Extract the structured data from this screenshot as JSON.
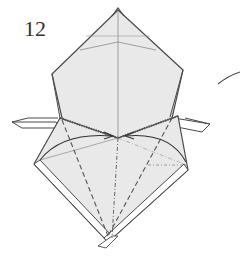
{
  "diagram": {
    "type": "origami-folding-step",
    "step_number": "12",
    "colors": {
      "background": "#ffffff",
      "paper_face": "#e9e9e9",
      "paper_white_edge": "#ffffff",
      "outline": "#4a4a4a",
      "crease": "#8a8a8a",
      "valley_fold": "#555555",
      "mountain_fold": "#666666",
      "arrow": "#333333"
    },
    "elements": [
      {
        "name": "top-point",
        "description": "head tip at top center"
      },
      {
        "name": "upper-body",
        "description": "pentagon shaped upper section with crease lines"
      },
      {
        "name": "left-flap",
        "description": "horizontal flap protruding left"
      },
      {
        "name": "right-flap",
        "description": "horizontal flap protruding right"
      },
      {
        "name": "lower-diamond",
        "description": "diamond shaped lower section with white border strip"
      },
      {
        "name": "left-valley-fold",
        "description": "dashed valley fold line from left shoulder to bottom"
      },
      {
        "name": "right-valley-fold",
        "description": "dashed valley fold line from right shoulder to bottom"
      },
      {
        "name": "center-mountain-fold",
        "description": "dash-dot mountain fold along center line"
      },
      {
        "name": "left-fold-arrow",
        "description": "curved arrow from left corner toward center"
      },
      {
        "name": "right-fold-arrow",
        "description": "curved arrow from right corner toward center"
      },
      {
        "name": "next-step-arrow",
        "description": "curved line at right edge pointing to next step"
      }
    ]
  }
}
